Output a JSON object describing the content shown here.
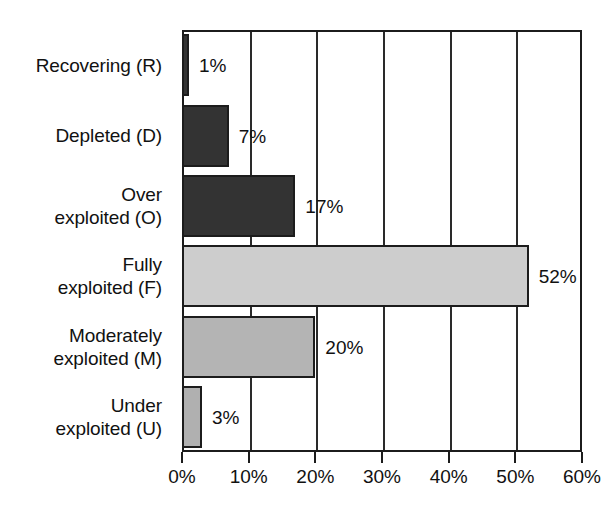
{
  "chart_data": {
    "type": "bar",
    "orientation": "horizontal",
    "title": "",
    "xlabel": "",
    "ylabel": "",
    "xlim": [
      0,
      60
    ],
    "grid": true,
    "legend": "none",
    "categories": [
      "Recovering (R)",
      "Depleted (D)",
      "Over exploited (O)",
      "Fully exploited (F)",
      "Moderately exploited (M)",
      "Under exploited (U)"
    ],
    "values": [
      1,
      7,
      17,
      52,
      20,
      3
    ],
    "value_labels": [
      "1%",
      "7%",
      "17%",
      "52%",
      "20%",
      "3%"
    ],
    "xticks": [
      0,
      10,
      20,
      30,
      40,
      50,
      60
    ],
    "xticklabels": [
      "0%",
      "10%",
      "20%",
      "30%",
      "40%",
      "50%",
      "60%"
    ],
    "bar_colors": [
      "#333333",
      "#333333",
      "#333333",
      "#cdcdcd",
      "#b4b4b4",
      "#b0b0b0"
    ],
    "bar_edge_color": "#1c1c1c"
  },
  "categories": [
    {
      "line1": "Recovering (R)",
      "line2": "",
      "value": 1,
      "label": "1%",
      "color": "#333333"
    },
    {
      "line1": "Depleted (D)",
      "line2": "",
      "value": 7,
      "label": "7%",
      "color": "#333333"
    },
    {
      "line1": "Over",
      "line2": "exploited (O)",
      "value": 17,
      "label": "17%",
      "color": "#333333"
    },
    {
      "line1": "Fully",
      "line2": "exploited (F)",
      "value": 52,
      "label": "52%",
      "color": "#cdcdcd"
    },
    {
      "line1": "Moderately",
      "line2": "exploited (M)",
      "value": 20,
      "label": "20%",
      "color": "#b4b4b4"
    },
    {
      "line1": "Under",
      "line2": "exploited (U)",
      "value": 3,
      "label": "3%",
      "color": "#b0b0b0"
    }
  ],
  "axis": {
    "ticks": [
      {
        "label": "0%",
        "value": 0
      },
      {
        "label": "10%",
        "value": 10
      },
      {
        "label": "20%",
        "value": 20
      },
      {
        "label": "30%",
        "value": 30
      },
      {
        "label": "40%",
        "value": 40
      },
      {
        "label": "50%",
        "value": 50
      },
      {
        "label": "60%",
        "value": 60
      }
    ]
  },
  "colors": {
    "dark_bar": "#333333",
    "light_bar": "#cdcdcd",
    "mid_bar": "#b4b4b4",
    "axis": "#1c1c1c",
    "background": "#ffffff"
  }
}
